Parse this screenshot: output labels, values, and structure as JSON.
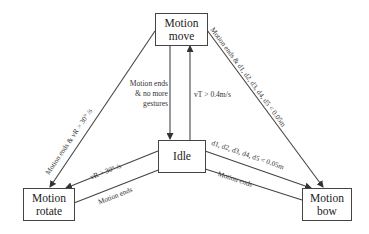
{
  "diagram": {
    "type": "state-machine",
    "colors": {
      "line": "#444444",
      "text": "#333333",
      "background": "#ffffff"
    },
    "nodes": {
      "move": {
        "line1": "Motion",
        "line2": "move"
      },
      "idle": {
        "label": "Idle"
      },
      "rotate": {
        "line1": "Motion",
        "line2": "rotate"
      },
      "bow": {
        "line1": "Motion",
        "line2": "bow"
      }
    },
    "edges": {
      "move_to_rotate": {
        "from": "Motion move",
        "to": "Motion rotate",
        "label": "Motion ends & vR > 30° /s"
      },
      "move_to_bow": {
        "from": "Motion move",
        "to": "Motion bow",
        "label": "Motion ends & d1, d2, d3, d4, d5 < 0.05m"
      },
      "move_to_idle": {
        "from": "Motion move",
        "to": "Idle",
        "label_line1": "Motion ends",
        "label_line2": "& no more",
        "label_line3": "gestures"
      },
      "idle_to_move": {
        "from": "Idle",
        "to": "Motion move",
        "label": "vT > 0.4m/s"
      },
      "idle_to_rotate": {
        "from": "Idle",
        "to": "Motion rotate",
        "label": "vR > 30° /s"
      },
      "rotate_to_idle": {
        "from": "Motion rotate",
        "to": "Idle",
        "label": "Motion ends"
      },
      "idle_to_bow": {
        "from": "Idle",
        "to": "Motion bow",
        "label": "d1, d2, d3, d4, d5 < 0.05m"
      },
      "bow_to_idle": {
        "from": "Motion bow",
        "to": "Idle",
        "label": "Motion ends"
      }
    }
  }
}
